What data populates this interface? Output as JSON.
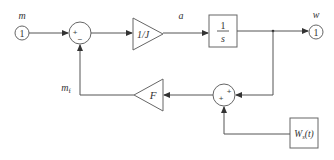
{
  "diagram": {
    "type": "block-diagram",
    "input_port": {
      "label": "m",
      "number": "1"
    },
    "output_port": {
      "label": "w",
      "number": "1"
    },
    "sum1": {
      "signs": [
        "+",
        "−"
      ]
    },
    "gain1": {
      "label": "1/J"
    },
    "signal_a": {
      "label": "a"
    },
    "integrator": {
      "numerator": "1",
      "denominator": "s"
    },
    "sum2": {
      "signs": [
        "+",
        "+"
      ]
    },
    "gain2": {
      "label": "F"
    },
    "feedback_signal": {
      "label": "m",
      "subscript": "f"
    },
    "disturbance": {
      "label": "W",
      "subscript": "s",
      "arg": "(t)"
    }
  },
  "colors": {
    "line": "#555555",
    "block": "#666666",
    "text": "#333333",
    "background": "#ffffff"
  }
}
